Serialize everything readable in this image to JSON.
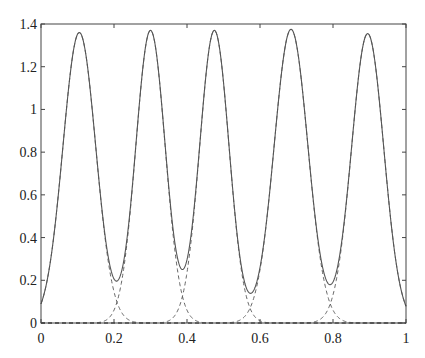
{
  "chart_data": {
    "type": "line",
    "title": "",
    "xlabel": "",
    "ylabel": "",
    "xlim": [
      0,
      1
    ],
    "ylim": [
      0,
      1.4
    ],
    "grid": false,
    "legend": null,
    "x_ticks": [
      "0",
      "0.2",
      "0.4",
      "0.6",
      "0.8",
      "1"
    ],
    "y_ticks": [
      "0",
      "0.2",
      "0.4",
      "0.6",
      "0.8",
      "1",
      "1.2",
      "1.4"
    ],
    "series": [
      {
        "name": "sum",
        "style": "solid",
        "description": "Sum of five peaked components",
        "peaks": [
          {
            "x": 0.105,
            "y": 1.36
          },
          {
            "x": 0.3,
            "y": 1.37
          },
          {
            "x": 0.475,
            "y": 1.37
          },
          {
            "x": 0.685,
            "y": 1.375
          },
          {
            "x": 0.895,
            "y": 1.355
          }
        ],
        "minima": [
          {
            "x": 0.21,
            "y": 0.135
          },
          {
            "x": 0.39,
            "y": 0.12
          },
          {
            "x": 0.565,
            "y": 0.135
          },
          {
            "x": 0.79,
            "y": 0.19
          }
        ],
        "endpoints": [
          {
            "x": 0,
            "y": 0.07
          },
          {
            "x": 1,
            "y": 0.06
          }
        ]
      },
      {
        "name": "components",
        "style": "dashed",
        "description": "Individual peak components, visible near the minima",
        "centers": [
          0.105,
          0.3,
          0.475,
          0.685,
          0.895
        ]
      }
    ]
  },
  "colors": {
    "line": "#555555",
    "axis": "#444444"
  }
}
